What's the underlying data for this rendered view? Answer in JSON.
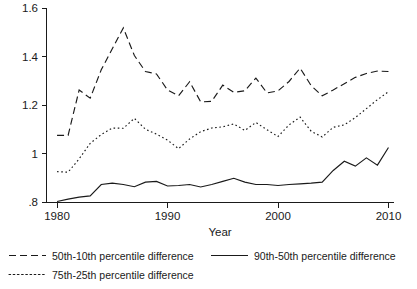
{
  "chart_data": {
    "type": "line",
    "title": "",
    "xlabel": "Year",
    "ylabel": "",
    "xlim": [
      1979,
      2010.5
    ],
    "ylim": [
      0.8,
      1.6
    ],
    "grid": false,
    "legend_position": "bottom",
    "x_ticks": [
      "1980",
      "1990",
      "2000",
      "2010"
    ],
    "x_tick_values": [
      1980,
      1990,
      2000,
      2010
    ],
    "y_ticks": [
      ".8",
      "1",
      "1.2",
      "1.4",
      "1.6"
    ],
    "y_tick_values": [
      0.8,
      1.0,
      1.2,
      1.4,
      1.6
    ],
    "x": [
      1980,
      1981,
      1982,
      1983,
      1984,
      1985,
      1986,
      1987,
      1988,
      1989,
      1990,
      1991,
      1992,
      1993,
      1994,
      1995,
      1996,
      1997,
      1998,
      1999,
      2000,
      2001,
      2002,
      2003,
      2004,
      2005,
      2006,
      2007,
      2008,
      2009,
      2010
    ],
    "series": [
      {
        "name": "50th-10th percentile difference",
        "style": "dashed",
        "values": [
          1.075,
          1.075,
          1.262,
          1.228,
          1.345,
          1.432,
          1.518,
          1.404,
          1.338,
          1.328,
          1.262,
          1.238,
          1.296,
          1.213,
          1.215,
          1.282,
          1.252,
          1.259,
          1.311,
          1.25,
          1.258,
          1.297,
          1.352,
          1.28,
          1.238,
          1.262,
          1.288,
          1.314,
          1.33,
          1.34,
          1.338
        ]
      },
      {
        "name": "75th-25th percentile difference",
        "style": "dotted",
        "values": [
          0.925,
          0.923,
          0.978,
          1.042,
          1.078,
          1.105,
          1.104,
          1.145,
          1.1,
          1.08,
          1.055,
          1.02,
          1.06,
          1.09,
          1.105,
          1.11,
          1.122,
          1.095,
          1.128,
          1.098,
          1.07,
          1.118,
          1.15,
          1.092,
          1.068,
          1.108,
          1.118,
          1.148,
          1.185,
          1.222,
          1.255
        ]
      },
      {
        "name": "90th-50th percentile difference",
        "style": "solid",
        "values": [
          0.802,
          0.812,
          0.82,
          0.825,
          0.872,
          0.878,
          0.872,
          0.863,
          0.882,
          0.885,
          0.866,
          0.868,
          0.872,
          0.862,
          0.872,
          0.885,
          0.898,
          0.882,
          0.872,
          0.872,
          0.868,
          0.872,
          0.875,
          0.878,
          0.882,
          0.93,
          0.968,
          0.948,
          0.982,
          0.952,
          1.025
        ]
      }
    ]
  },
  "legend": {
    "items": [
      {
        "label": "50th-10th percentile difference",
        "style": "dashed"
      },
      {
        "label": "90th-50th percentile difference",
        "style": "solid"
      },
      {
        "label": "75th-25th percentile difference",
        "style": "dotted"
      }
    ]
  },
  "colors": {
    "ink": "#1a1a1a",
    "background": "#ffffff"
  }
}
